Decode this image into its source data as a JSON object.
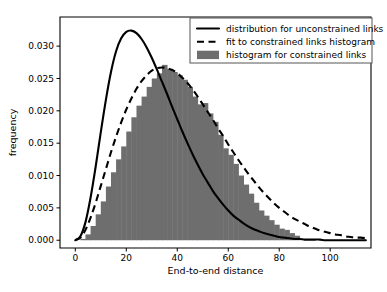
{
  "chart_data": {
    "type": "bar",
    "title": "",
    "xlabel": "End-to-end distance",
    "ylabel": "frequency",
    "xlim": [
      -6,
      116
    ],
    "ylim": [
      -0.0012,
      0.0345
    ],
    "xticks": [
      0,
      20,
      40,
      60,
      80,
      100
    ],
    "yticks": [
      0.0,
      0.005,
      0.01,
      0.015,
      0.02,
      0.025,
      0.03
    ],
    "ytick_labels": [
      "0.000",
      "0.005",
      "0.010",
      "0.015",
      "0.020",
      "0.025",
      "0.030"
    ],
    "xtick_labels": [
      "0",
      "20",
      "40",
      "60",
      "80",
      "100"
    ],
    "grid": false,
    "legend_position": "upper right",
    "bar_width": 2,
    "bar_color": "#6e6e6e",
    "line_color": "#000000",
    "legend": [
      {
        "label": "distribution for unconstrained links",
        "marker": "solid-line"
      },
      {
        "label": "fit to constrained links histogram",
        "marker": "dashed-line"
      },
      {
        "label": "histogram for constrained links",
        "marker": "filled-patch"
      }
    ],
    "series": [
      {
        "name": "histogram for constrained links",
        "type": "bar",
        "x": [
          1,
          3,
          5,
          7,
          9,
          11,
          13,
          15,
          17,
          19,
          21,
          23,
          25,
          27,
          29,
          31,
          33,
          35,
          37,
          39,
          41,
          43,
          45,
          47,
          49,
          51,
          53,
          55,
          57,
          59,
          61,
          63,
          65,
          67,
          69,
          71,
          73,
          75,
          77,
          79,
          81,
          83,
          85,
          87
        ],
        "values": [
          0.0,
          0.0002,
          0.0009,
          0.0022,
          0.004,
          0.006,
          0.0083,
          0.0105,
          0.0125,
          0.0145,
          0.0168,
          0.019,
          0.0208,
          0.0222,
          0.0237,
          0.025,
          0.0258,
          0.0271,
          0.0265,
          0.026,
          0.0255,
          0.0248,
          0.0237,
          0.0222,
          0.021,
          0.0212,
          0.0196,
          0.0183,
          0.0163,
          0.0142,
          0.0132,
          0.0118,
          0.01,
          0.0086,
          0.0072,
          0.0058,
          0.0046,
          0.0038,
          0.0031,
          0.0024,
          0.0018,
          0.0016,
          0.0011,
          0.0007
        ]
      },
      {
        "name": "fit to constrained links histogram",
        "type": "line",
        "style": "dashed",
        "x": [
          0,
          2,
          4,
          6,
          8,
          10,
          12,
          14,
          16,
          18,
          20,
          22,
          24,
          26,
          28,
          30,
          32,
          34,
          36,
          38,
          40,
          42,
          44,
          46,
          48,
          50,
          52,
          54,
          56,
          58,
          60,
          62,
          64,
          66,
          68,
          70,
          72,
          74,
          76,
          78,
          80,
          82,
          84,
          86,
          88,
          90,
          92,
          94,
          96,
          98,
          100,
          102,
          104,
          106,
          108,
          110,
          112,
          114
        ],
        "values": [
          0.0,
          0.0004,
          0.0016,
          0.0035,
          0.0058,
          0.0084,
          0.011,
          0.0136,
          0.016,
          0.0182,
          0.0202,
          0.0219,
          0.0234,
          0.0246,
          0.0255,
          0.0262,
          0.0266,
          0.0267,
          0.0266,
          0.0263,
          0.0258,
          0.0251,
          0.0243,
          0.0233,
          0.0222,
          0.021,
          0.0198,
          0.0186,
          0.0173,
          0.0161,
          0.0148,
          0.0136,
          0.0124,
          0.0113,
          0.0102,
          0.0092,
          0.0082,
          0.0073,
          0.0065,
          0.0057,
          0.005,
          0.0044,
          0.0038,
          0.0033,
          0.0029,
          0.0025,
          0.0021,
          0.0018,
          0.0015,
          0.0013,
          0.0011,
          0.0009,
          0.0008,
          0.0006,
          0.0005,
          0.0004,
          0.0004,
          0.0003
        ]
      },
      {
        "name": "distribution for unconstrained links",
        "type": "line",
        "style": "solid",
        "x": [
          0,
          2,
          4,
          6,
          8,
          10,
          12,
          14,
          16,
          18,
          20,
          22,
          24,
          26,
          28,
          30,
          32,
          34,
          36,
          38,
          40,
          42,
          44,
          46,
          48,
          50,
          52,
          54,
          56,
          58,
          60,
          62,
          64,
          66,
          68,
          70,
          72,
          74,
          76,
          78,
          80,
          82,
          84,
          86,
          88,
          90,
          92,
          94,
          96,
          98,
          100,
          102,
          104,
          106,
          108,
          110,
          112,
          114
        ],
        "values": [
          0.0,
          0.0006,
          0.0028,
          0.0066,
          0.0114,
          0.0167,
          0.0217,
          0.026,
          0.0292,
          0.0312,
          0.0322,
          0.0324,
          0.032,
          0.0311,
          0.0298,
          0.0282,
          0.0264,
          0.0245,
          0.0226,
          0.0206,
          0.0187,
          0.0168,
          0.015,
          0.0133,
          0.0117,
          0.0102,
          0.0089,
          0.0076,
          0.0065,
          0.0055,
          0.0046,
          0.0038,
          0.0032,
          0.0026,
          0.0021,
          0.0017,
          0.0014,
          0.0011,
          0.0009,
          0.0007,
          0.0005,
          0.0004,
          0.0003,
          0.0002,
          0.0002,
          0.0001,
          0.0001,
          0.0001,
          0.0001,
          0.0,
          0.0,
          0.0,
          0.0,
          0.0,
          0.0,
          0.0,
          0.0,
          0.0
        ]
      }
    ]
  },
  "plot_geometry": {
    "left": 60,
    "right": 371,
    "top": 17,
    "bottom": 248
  },
  "legend_geometry": {
    "x": 190,
    "y": 18,
    "width": 182,
    "height": 45
  }
}
